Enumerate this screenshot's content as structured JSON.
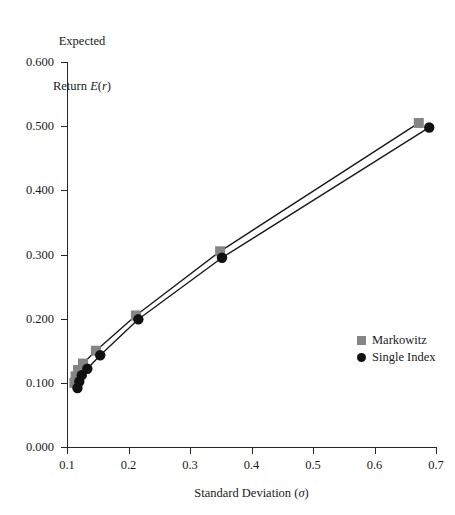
{
  "chart_data": {
    "type": "line",
    "title": "",
    "xlabel": "Standard Deviation (σ)",
    "ylabel": "Expected Return E(r)",
    "ylabel_line1": "Expected",
    "ylabel_line2_prefix": "Return ",
    "ylabel_line2_italic": "E",
    "ylabel_line2_suffix_open": "(",
    "ylabel_line2_italic2": "r",
    "ylabel_line2_suffix_close": ")",
    "xlabel_prefix": "Standard Deviation (",
    "xlabel_italic": "σ",
    "xlabel_suffix": ")",
    "xlim": [
      0.1,
      0.7
    ],
    "ylim": [
      0.0,
      0.6
    ],
    "xticks": [
      0.1,
      0.2,
      0.3,
      0.4,
      0.5,
      0.6,
      0.7
    ],
    "xtick_labels": [
      "0.1",
      "0.2",
      "0.3",
      "0.4",
      "0.5",
      "0.6",
      "0.7"
    ],
    "yticks": [
      0.0,
      0.1,
      0.2,
      0.3,
      0.4,
      0.5,
      0.6
    ],
    "ytick_labels": [
      "0.000",
      "0.100",
      "0.200",
      "0.300",
      "0.400",
      "0.500",
      "0.600"
    ],
    "grid": false,
    "legend_position": "center-right",
    "series": [
      {
        "name": "Markowitz",
        "marker": "square",
        "color": "#858585",
        "line_color": "#1a1a1a",
        "x": [
          0.112,
          0.114,
          0.118,
          0.126,
          0.147,
          0.212,
          0.349,
          0.672
        ],
        "y": [
          0.1,
          0.11,
          0.12,
          0.13,
          0.15,
          0.205,
          0.305,
          0.505
        ]
      },
      {
        "name": "Single Index",
        "marker": "circle",
        "color": "#111111",
        "line_color": "#1a1a1a",
        "x": [
          0.117,
          0.12,
          0.124,
          0.133,
          0.154,
          0.216,
          0.352,
          0.689
        ],
        "y": [
          0.092,
          0.102,
          0.112,
          0.122,
          0.143,
          0.199,
          0.295,
          0.498
        ]
      }
    ]
  },
  "legend": {
    "items": [
      {
        "label": "Markowitz",
        "marker": "square",
        "color": "#858585"
      },
      {
        "label": "Single Index",
        "marker": "circle",
        "color": "#111111"
      }
    ]
  },
  "colors": {
    "markowitz": "#858585",
    "single_index": "#111111",
    "axis": "#262626",
    "line": "#1a1a1a",
    "background": "#ffffff"
  }
}
